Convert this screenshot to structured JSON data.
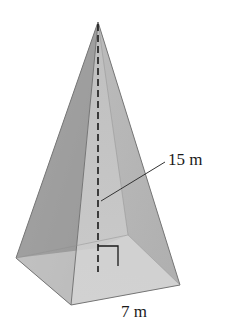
{
  "figure": {
    "type": "square pyramid",
    "labels": {
      "height": "15 m",
      "base_side": "7 m"
    },
    "annotations": {
      "height_line": "dashed vertical line from apex to base center",
      "right_angle_marker": true,
      "leader_line": "from height label to dashed height line"
    },
    "colors": {
      "background": "#ffffff",
      "left_face": "#9c9c9c",
      "front_face": "#c2c2c2",
      "right_face": "#b3b3b3",
      "base": "#d4d4d4",
      "edge": "#6e6e6e",
      "line": "#1a1a1a"
    }
  }
}
